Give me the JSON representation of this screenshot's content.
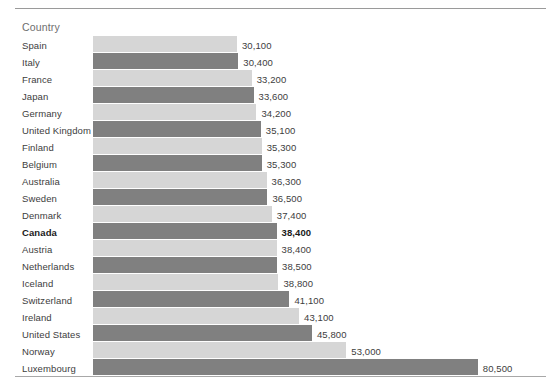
{
  "header": {
    "axis_title": "Country"
  },
  "style": {
    "bar_light": "#d6d6d6",
    "bar_dark": "#808080",
    "text": "#3d3d3d",
    "header_text": "#6e6e6e",
    "rule": "#9a9a9a",
    "background": "#ffffff"
  },
  "chart_data": {
    "type": "bar",
    "orientation": "horizontal",
    "title": "",
    "subtitle": "",
    "xlabel": "",
    "ylabel": "Country",
    "grid": false,
    "legend": "none",
    "axis_visible": false,
    "sort": "ascending",
    "xlim": [
      0,
      80500
    ],
    "highlight_category": "Canada",
    "bar_color_pattern": [
      "light",
      "dark"
    ],
    "categories": [
      "Spain",
      "Italy",
      "France",
      "Japan",
      "Germany",
      "United Kingdom",
      "Finland",
      "Belgium",
      "Australia",
      "Sweden",
      "Denmark",
      "Canada",
      "Austria",
      "Netherlands",
      "Iceland",
      "Switzerland",
      "Ireland",
      "United States",
      "Norway",
      "Luxembourg"
    ],
    "values": [
      30100,
      30400,
      33200,
      33600,
      34200,
      35100,
      35300,
      35300,
      36300,
      36500,
      37400,
      38400,
      38400,
      38500,
      38800,
      41100,
      43100,
      45800,
      53000,
      80500
    ],
    "value_labels": [
      "30,100",
      "30,400",
      "33,200",
      "33,600",
      "34,200",
      "35,100",
      "35,300",
      "35,300",
      "36,300",
      "36,500",
      "37,400",
      "38,400",
      "38,400",
      "38,500",
      "38,800",
      "41,100",
      "43,100",
      "45,800",
      "53,000",
      "80,500"
    ]
  }
}
